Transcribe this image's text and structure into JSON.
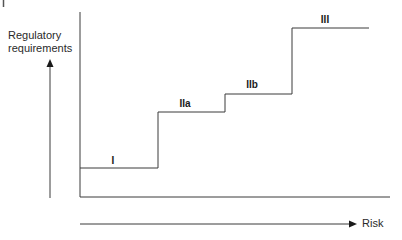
{
  "diagram": {
    "y_axis_label": [
      "Regulatory",
      "requirements"
    ],
    "x_axis_label": "Risk",
    "steps": [
      {
        "label": "I",
        "x_start": 80,
        "x_end": 158,
        "y": 168,
        "label_x": 113,
        "label_y": 156
      },
      {
        "label": "IIa",
        "x_start": 158,
        "x_end": 225,
        "y": 112,
        "label_x": 184,
        "label_y": 100
      },
      {
        "label": "IIb",
        "x_start": 225,
        "x_end": 292,
        "y": 94,
        "label_x": 251,
        "label_y": 82
      },
      {
        "label": "III",
        "x_start": 292,
        "x_end": 369,
        "y": 28,
        "label_x": 324,
        "label_y": 16
      }
    ],
    "colors": {
      "line": "#3a3a3a",
      "text": "#1a1a1a"
    }
  }
}
